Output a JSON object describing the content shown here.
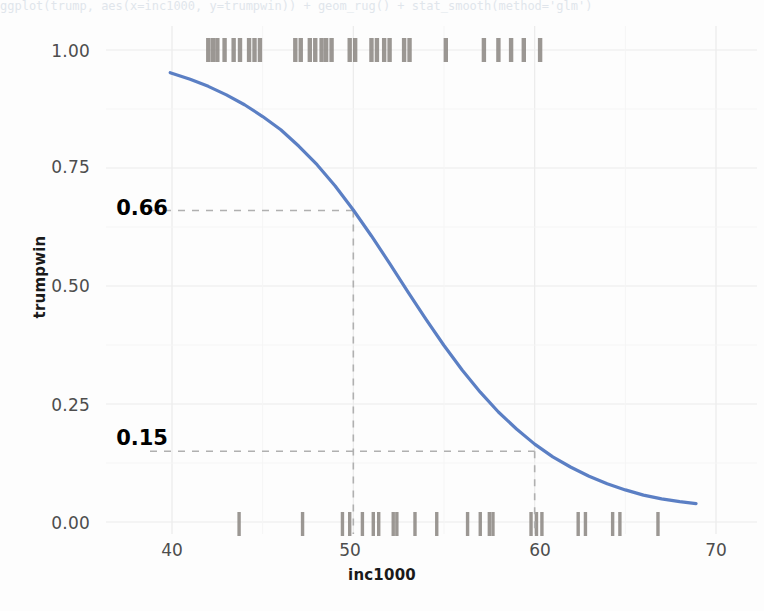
{
  "top_code_line": "ggplot(trump, aes(x=inc1000, y=trumpwin)) + geom_rug() + stat_smooth(method='glm')",
  "chart_data": {
    "type": "line",
    "title": "",
    "xlabel": "inc1000",
    "ylabel": "trumpwin",
    "xlim": [
      38.8,
      71.0
    ],
    "ylim": [
      -0.035,
      1.05
    ],
    "xticks": [
      40,
      50,
      60,
      70
    ],
    "xtick_labels": [
      "40",
      "50",
      "60",
      "70"
    ],
    "yticks": [
      0.0,
      0.25,
      0.5,
      0.75,
      1.0
    ],
    "ytick_labels": [
      "0.00",
      "0.25",
      "0.50",
      "0.75",
      "1.00"
    ],
    "grid": true,
    "legend": "none",
    "series": [
      {
        "name": "logistic fit",
        "color": "#5b7fc4",
        "linewidth": 3.2,
        "x": [
          39.9,
          41.0,
          42.0,
          43.0,
          44.0,
          45.0,
          46.0,
          47.0,
          48.0,
          49.0,
          50.0,
          51.0,
          52.0,
          53.0,
          54.0,
          55.0,
          56.0,
          57.0,
          58.0,
          59.0,
          60.0,
          61.0,
          62.0,
          63.0,
          64.0,
          65.0,
          66.0,
          67.0,
          68.0,
          68.9
        ],
        "y": [
          0.952,
          0.938,
          0.923,
          0.905,
          0.884,
          0.859,
          0.831,
          0.796,
          0.757,
          0.712,
          0.661,
          0.606,
          0.548,
          0.488,
          0.43,
          0.374,
          0.322,
          0.275,
          0.233,
          0.197,
          0.165,
          0.138,
          0.116,
          0.097,
          0.081,
          0.068,
          0.057,
          0.049,
          0.043,
          0.039
        ]
      }
    ],
    "rug_top_label": "trumpwin = 1",
    "rug_bottom_label": "trumpwin = 0",
    "rug_color": "#8a8580",
    "rug_top_values": [
      42.0,
      42.25,
      42.5,
      42.9,
      43.4,
      43.75,
      44.25,
      44.55,
      44.85,
      46.8,
      47.1,
      47.6,
      47.9,
      48.25,
      48.5,
      48.8,
      49.8,
      50.1,
      51.0,
      51.3,
      51.7,
      52.0,
      52.8,
      53.1,
      55.1,
      57.2,
      58.0,
      58.7,
      59.4,
      60.3
    ],
    "rug_bottom_values": [
      43.7,
      47.2,
      49.4,
      49.8,
      50.5,
      51.1,
      51.4,
      52.2,
      52.4,
      53.4,
      54.6,
      56.3,
      57.0,
      57.5,
      57.7,
      59.8,
      60.1,
      60.4,
      62.4,
      62.8,
      64.3,
      64.7,
      66.8
    ],
    "annotations": [
      {
        "label": "0.66",
        "x": 50,
        "y": 0.66,
        "style": "dashed-guide",
        "color": "#000000",
        "guide_color": "#b0b0b0"
      },
      {
        "label": "0.15",
        "x": 60,
        "y": 0.15,
        "style": "dashed-guide",
        "color": "#000000",
        "guide_color": "#b0b0b0"
      }
    ]
  },
  "axis": {
    "y_title": "trumpwin",
    "x_title": "inc1000"
  }
}
